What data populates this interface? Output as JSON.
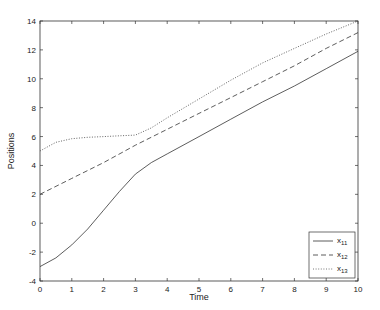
{
  "chart_data": {
    "type": "line",
    "title": "",
    "xlabel": "Time",
    "ylabel": "Positions",
    "xlim": [
      0,
      10
    ],
    "ylim": [
      -4,
      14
    ],
    "xticks": [
      0,
      1,
      2,
      3,
      4,
      5,
      6,
      7,
      8,
      9,
      10
    ],
    "yticks": [
      -4,
      -2,
      0,
      2,
      4,
      6,
      8,
      10,
      12,
      14
    ],
    "grid": false,
    "legend_position": "lower right",
    "series": [
      {
        "name": "x11",
        "label_base": "x",
        "label_sub": "11",
        "style": "solid",
        "color": "#333333",
        "x": [
          0,
          0.5,
          1,
          1.5,
          2,
          2.5,
          3,
          3.5,
          4,
          5,
          6,
          7,
          8,
          9,
          10
        ],
        "values": [
          -3.0,
          -2.4,
          -1.5,
          -0.4,
          0.9,
          2.2,
          3.4,
          4.2,
          4.8,
          6.0,
          7.2,
          8.4,
          9.5,
          10.7,
          11.9
        ]
      },
      {
        "name": "x12",
        "label_base": "x",
        "label_sub": "12",
        "style": "dashed",
        "color": "#333333",
        "x": [
          0,
          1,
          2,
          3,
          4,
          5,
          6,
          7,
          8,
          9,
          10
        ],
        "values": [
          2.0,
          3.1,
          4.2,
          5.4,
          6.5,
          7.6,
          8.7,
          9.8,
          10.9,
          12.1,
          13.2
        ]
      },
      {
        "name": "x13",
        "label_base": "x",
        "label_sub": "13",
        "style": "dotted",
        "color": "#555555",
        "x": [
          0,
          0.5,
          1,
          1.5,
          2,
          2.5,
          3,
          3.5,
          4,
          5,
          6,
          7,
          8,
          9,
          10
        ],
        "values": [
          5.0,
          5.6,
          5.85,
          5.95,
          6.0,
          6.05,
          6.1,
          6.6,
          7.3,
          8.6,
          9.9,
          11.1,
          12.1,
          13.1,
          14.0
        ]
      }
    ]
  }
}
